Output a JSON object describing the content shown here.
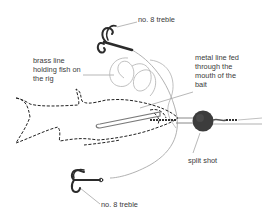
{
  "diagram": {
    "labels": {
      "top_treble": "no. 8 treble",
      "brass_line": "brass line\nholding fish on\nthe rig",
      "metal_line": "metal line fed\nthrough the\nmouth of the\nbait",
      "split_shot": "split shot",
      "bottom_treble": "no. 8 treble"
    },
    "colors": {
      "text": "#3a3a3a",
      "line": "#9a9a9a",
      "hook": "#2b2b2b",
      "fish_outline": "#222222",
      "split_shot": "#3c3c3c",
      "background": "#ffffff"
    }
  }
}
